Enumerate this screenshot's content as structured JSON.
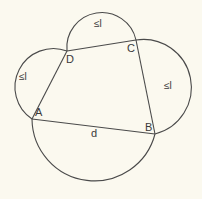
{
  "diagram": {
    "background": "#fbf9ef",
    "stroke": "#4a4a4a",
    "vertices": [
      {
        "name": "A",
        "x": 32,
        "y": 119,
        "label_x": 35,
        "label_y": 116
      },
      {
        "name": "B",
        "x": 155,
        "y": 134,
        "label_x": 145,
        "label_y": 131
      },
      {
        "name": "C",
        "x": 136,
        "y": 40,
        "label_x": 127,
        "label_y": 52
      },
      {
        "name": "D",
        "x": 67,
        "y": 51,
        "label_x": 66,
        "label_y": 63
      }
    ],
    "sides": [
      {
        "from": "A",
        "to": "B"
      },
      {
        "from": "B",
        "to": "C"
      },
      {
        "from": "C",
        "to": "D"
      },
      {
        "from": "D",
        "to": "A"
      }
    ],
    "arcs": [
      {
        "side": "DA",
        "path": "M 67 51 A 38.5 38.5 0 0 0 32 119",
        "label": "≤l",
        "label_x": 19,
        "label_y": 80
      },
      {
        "side": "DC",
        "path": "M 67 51 A 35 35 0 0 1 136 40",
        "label": "≤l",
        "label_x": 94,
        "label_y": 27
      },
      {
        "side": "CB",
        "path": "M 136 40 A 48 48 0 0 1 155 134",
        "label": "≤l",
        "label_x": 164,
        "label_y": 89
      },
      {
        "side": "AB",
        "path": "M 32 119 A 62.5 62.5 0 0 0 155 134",
        "label": "",
        "label_x": 0,
        "label_y": 0
      }
    ],
    "side_label": {
      "text": "d",
      "x": 91,
      "y": 137
    }
  }
}
